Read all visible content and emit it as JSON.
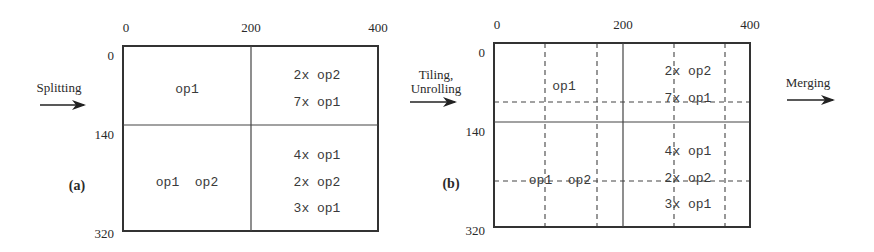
{
  "figure": {
    "steps": [
      {
        "label_line1": "Splitting",
        "label_line2": ""
      },
      {
        "label_line1": "Tiling,",
        "label_line2": "Unrolling"
      },
      {
        "label_line1": "Merging",
        "label_line2": ""
      }
    ],
    "panels": [
      {
        "id": "a",
        "caption": "(a)",
        "x_ticks": [
          "0",
          "200",
          "400"
        ],
        "y_ticks": [
          "0",
          "140",
          "320"
        ],
        "cells": {
          "top_left": [
            "op1"
          ],
          "top_right": [
            "2x op2",
            "7x op1"
          ],
          "bottom_left": [
            "op1  op2"
          ],
          "bottom_right": [
            "4x op1",
            "2x op2",
            "3x op1"
          ]
        }
      },
      {
        "id": "b",
        "caption": "(b)",
        "x_ticks": [
          "0",
          "200",
          "400"
        ],
        "y_ticks": [
          "0",
          "140",
          "320"
        ],
        "cells": {
          "top_left": [
            "op1"
          ],
          "top_right": [
            "2x op2",
            "7x op1"
          ],
          "bottom_left": [
            "op1  op2"
          ],
          "bottom_right": [
            "4x op1",
            "2x op2",
            "3x op1"
          ]
        },
        "dashed_tiles": {
          "vertical_count": 4,
          "horizontal_count": 2
        }
      }
    ]
  }
}
